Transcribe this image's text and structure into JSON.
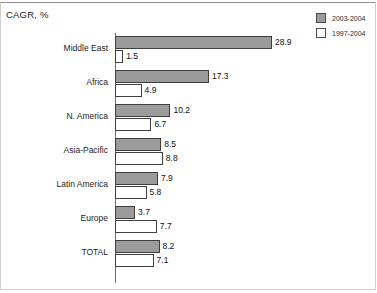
{
  "chart": {
    "title": "CAGR, %"
  },
  "legend": {
    "items": [
      {
        "label": "2003-2004",
        "swatch": "filled",
        "color": "#9b9b9b"
      },
      {
        "label": "1997-2004",
        "swatch": "hollow",
        "color": "#ffffff"
      }
    ]
  },
  "chart_data": {
    "type": "bar",
    "orientation": "horizontal",
    "title": "CAGR, %",
    "xlabel": "",
    "ylabel": "",
    "xlim": [
      0,
      28.9
    ],
    "grid": false,
    "legend_position": "top-right",
    "categories": [
      "Middle East",
      "Africa",
      "N. America",
      "Asia-Pacific",
      "Latin America",
      "Europe",
      "TOTAL"
    ],
    "series": [
      {
        "name": "2003-2004",
        "color": "#9b9b9b",
        "values": [
          28.9,
          17.3,
          10.2,
          8.5,
          7.9,
          3.7,
          8.2
        ],
        "labels": [
          "28.9",
          "17.3",
          "10.2",
          "8.5",
          "7.9",
          "3.7",
          "8.2"
        ]
      },
      {
        "name": "1997-2004",
        "color": "#ffffff",
        "values": [
          1.5,
          4.9,
          6.7,
          8.8,
          5.8,
          7.7,
          7.1
        ],
        "labels": [
          "1.5",
          "4.9",
          "6.7",
          "8.8",
          "5.8",
          "7.7",
          "7.1"
        ]
      }
    ]
  }
}
